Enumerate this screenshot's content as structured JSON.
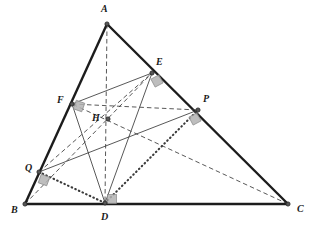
{
  "figure": {
    "background_color": "#ffffff",
    "stroke_color": "#1c1c1c",
    "thin_stroke_color": "#3a3a3a",
    "right_angle_fill": "#b3b3b3",
    "right_angle_stroke": "#8a8a8a",
    "vertex_fill": "#555555",
    "vertex_stroke": "#222222"
  },
  "points": [
    {
      "id": "A",
      "label": "A",
      "x": 107,
      "y": 24,
      "label_x": 101,
      "label_y": 4,
      "kind": "triangle-vertex"
    },
    {
      "id": "B",
      "label": "B",
      "x": 25,
      "y": 204,
      "label_x": 11,
      "label_y": 205,
      "kind": "triangle-vertex"
    },
    {
      "id": "C",
      "label": "C",
      "x": 288,
      "y": 204,
      "label_x": 297,
      "label_y": 204,
      "kind": "triangle-vertex"
    },
    {
      "id": "D",
      "label": "D",
      "x": 105,
      "y": 203,
      "label_x": 101,
      "label_y": 212,
      "kind": "foot-of-altitude"
    },
    {
      "id": "E",
      "label": "E",
      "x": 152,
      "y": 73,
      "label_x": 156,
      "label_y": 57,
      "kind": "point-on-side-AC"
    },
    {
      "id": "F",
      "label": "F",
      "x": 72,
      "y": 104,
      "label_x": 57,
      "label_y": 95,
      "kind": "point-on-side-AB"
    },
    {
      "id": "P",
      "label": "P",
      "x": 198,
      "y": 110,
      "label_x": 203,
      "label_y": 94,
      "kind": "point-on-side-AC"
    },
    {
      "id": "Q",
      "label": "Q",
      "x": 39,
      "y": 172,
      "label_x": 25,
      "label_y": 163,
      "kind": "point-on-side-AB"
    },
    {
      "id": "H",
      "label": "H",
      "x": 108,
      "y": 119,
      "label_x": 92,
      "label_y": 113,
      "kind": "orthocenter"
    }
  ],
  "segments": [
    {
      "id": "AB",
      "from": "A",
      "to": "B",
      "style": "solid",
      "weight": "thick"
    },
    {
      "id": "AC",
      "from": "A",
      "to": "C",
      "style": "solid",
      "weight": "thick"
    },
    {
      "id": "BC",
      "from": "B",
      "to": "C",
      "style": "solid",
      "weight": "thick"
    },
    {
      "id": "AD",
      "from": "A",
      "to": "D",
      "style": "dashed",
      "weight": "thin"
    },
    {
      "id": "BE",
      "from": "B",
      "to": "E",
      "style": "dashed",
      "weight": "thin"
    },
    {
      "id": "CF",
      "from": "C",
      "to": "F",
      "style": "dashed",
      "weight": "thin"
    },
    {
      "id": "FE",
      "from": "F",
      "to": "E",
      "style": "solid",
      "weight": "thin"
    },
    {
      "id": "QP",
      "from": "Q",
      "to": "P",
      "style": "solid",
      "weight": "thin"
    },
    {
      "id": "DE",
      "from": "D",
      "to": "E",
      "style": "solid",
      "weight": "thin"
    },
    {
      "id": "DF",
      "from": "D",
      "to": "F",
      "style": "solid",
      "weight": "thin"
    },
    {
      "id": "QE",
      "from": "Q",
      "to": "E",
      "style": "dashed",
      "weight": "thin"
    },
    {
      "id": "FP",
      "from": "F",
      "to": "P",
      "style": "dashed",
      "weight": "thin"
    },
    {
      "id": "QD",
      "from": "Q",
      "to": "D",
      "style": "dotted",
      "weight": "thin"
    },
    {
      "id": "DP",
      "from": "D",
      "to": "P",
      "style": "dotted",
      "weight": "thin"
    }
  ],
  "right_angle_marks": [
    {
      "id": "ra-D",
      "at": "D",
      "cx": 112,
      "cy": 199,
      "rotation": 0,
      "size": 9
    },
    {
      "id": "ra-E",
      "at": "E",
      "cx": 157,
      "cy": 81,
      "rotation": -28,
      "size": 9
    },
    {
      "id": "ra-F",
      "at": "F",
      "cx": 79,
      "cy": 106,
      "rotation": 20,
      "size": 9
    },
    {
      "id": "ra-P",
      "at": "P",
      "cx": 195,
      "cy": 119,
      "rotation": -28,
      "size": 9
    },
    {
      "id": "ra-Q",
      "at": "Q",
      "cx": 44,
      "cy": 180,
      "rotation": 20,
      "size": 9
    }
  ],
  "chart_data": {
    "type": "diagram",
    "vertices": {
      "A": [
        107,
        24
      ],
      "B": [
        25,
        204
      ],
      "C": [
        288,
        204
      ]
    },
    "constructed_points": {
      "D": [
        105,
        203
      ],
      "E": [
        152,
        73
      ],
      "F": [
        72,
        104
      ],
      "P": [
        198,
        110
      ],
      "Q": [
        39,
        172
      ],
      "H": [
        108,
        119
      ]
    },
    "line_styles": {
      "sides": "solid-thick",
      "altitudes": "dashed",
      "midlines": "solid-thin",
      "connectors": "dotted"
    },
    "markers": [
      "right-angle-square at D",
      "right-angle-square at E",
      "right-angle-square at F",
      "right-angle-square at P",
      "right-angle-square at Q"
    ]
  }
}
